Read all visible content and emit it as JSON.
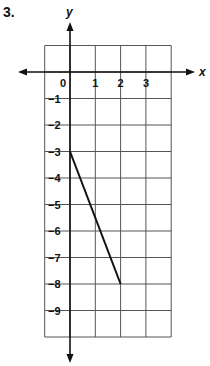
{
  "problem": {
    "number": "3."
  },
  "chart_data": {
    "type": "line",
    "title": "",
    "xlabel": "x",
    "ylabel": "y",
    "grid": true,
    "xlim": [
      -1,
      4
    ],
    "ylim": [
      -10,
      1
    ],
    "x_tick_labels": [
      "0",
      "1",
      "2",
      "3"
    ],
    "y_tick_labels": [
      "-1",
      "-2",
      "-3",
      "-4",
      "-5",
      "-6",
      "-7",
      "-8",
      "-9"
    ],
    "series": [
      {
        "name": "segment",
        "points": [
          [
            0,
            -3
          ],
          [
            2,
            -8
          ]
        ]
      }
    ]
  },
  "colors": {
    "grid": "#555555",
    "axis": "#111111",
    "line": "#111111"
  }
}
